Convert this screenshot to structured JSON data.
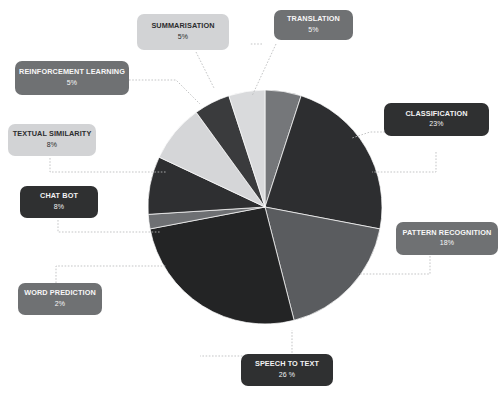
{
  "canvas": {
    "width": 502,
    "height": 397,
    "background": "#ffffff"
  },
  "chart_data": {
    "type": "pie",
    "title": "",
    "subtitle": "",
    "xlabel": "",
    "ylabel": "",
    "legend_position": "callout-labels",
    "grid": false,
    "total_labeled": "95%",
    "units": "percent",
    "categories": [
      "TRANSLATION",
      "CLASSIFICATION",
      "PATTERN RECOGNITION",
      "SPEECH TO TEXT",
      "WORD PREDICTION",
      "CHAT BOT",
      "TEXTUAL SIMILARITY",
      "REINFORCEMENT LEARNING",
      "SUMMARISATION"
    ],
    "values": [
      5,
      23,
      18,
      26,
      2,
      8,
      8,
      5,
      5
    ],
    "value_labels": [
      "5%",
      "23%",
      "18%",
      "26 %",
      "2%",
      "8%",
      "8%",
      "5%",
      "5%"
    ],
    "slice_colors": [
      "#75777a",
      "#2d2e30",
      "#5a5c5f",
      "#232425",
      "#6e7073",
      "#2e2f31",
      "#d5d6d8",
      "#3a3b3d",
      "#d9dadc"
    ],
    "start_angle_deg": 0,
    "direction": "clockwise",
    "center": {
      "x": 265,
      "y": 207
    },
    "radius": 117
  },
  "callouts": [
    {
      "key": "summarisation",
      "title": "SUMMARISATION",
      "value": "5%",
      "style": "light"
    },
    {
      "key": "translation",
      "title": "TRANSLATION",
      "value": "5%",
      "style": "mid"
    },
    {
      "key": "reinforcement-learning",
      "title": "REINFORCEMENT LEARNING",
      "value": "5%",
      "style": "mid"
    },
    {
      "key": "classification",
      "title": "CLASSIFICATION",
      "value": "23%",
      "style": "dark"
    },
    {
      "key": "textual-similarity",
      "title": "TEXTUAL SIMILARITY",
      "value": "8%",
      "style": "light"
    },
    {
      "key": "chat-bot",
      "title": "CHAT BOT",
      "value": "8%",
      "style": "dark"
    },
    {
      "key": "pattern-recognition",
      "title": "PATTERN RECOGNITION",
      "value": "18%",
      "style": "mid"
    },
    {
      "key": "word-prediction",
      "title": "WORD PREDICTION",
      "value": "2%",
      "style": "mid"
    },
    {
      "key": "speech-to-text",
      "title": "SPEECH TO TEXT",
      "value": "26 %",
      "style": "dark"
    }
  ]
}
